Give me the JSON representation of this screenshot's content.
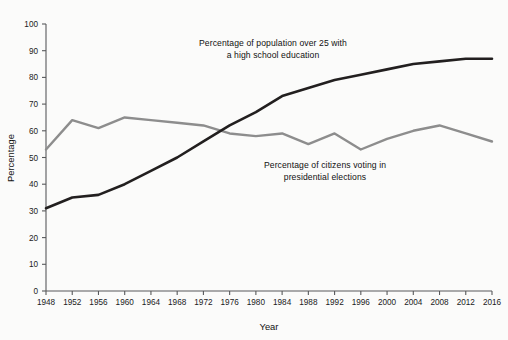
{
  "chart_data": {
    "type": "line",
    "title": "",
    "xlabel": "Year",
    "ylabel": "Percentage",
    "xlim": [
      1948,
      2016
    ],
    "ylim": [
      0,
      100
    ],
    "grid": false,
    "legend_position": "inline-annotations",
    "x": [
      1948,
      1952,
      1956,
      1960,
      1964,
      1968,
      1972,
      1976,
      1980,
      1984,
      1988,
      1992,
      1996,
      2000,
      2004,
      2008,
      2012,
      2016
    ],
    "xtick_labels": [
      "1948",
      "1952",
      "1956",
      "1960",
      "1964",
      "1968",
      "1972",
      "1976",
      "1980",
      "1984",
      "1988",
      "1992",
      "1996",
      "2000",
      "2004",
      "2008",
      "2012",
      "2016"
    ],
    "ytick_labels": [
      "0",
      "10",
      "20",
      "30",
      "40",
      "50",
      "60",
      "70",
      "80",
      "90",
      "100"
    ],
    "yticks": [
      0,
      10,
      20,
      30,
      40,
      50,
      60,
      70,
      80,
      90,
      100
    ],
    "series": [
      {
        "name": "Percentage of population over 25 with a high school education",
        "color": "#221f1f",
        "values": [
          31,
          35,
          36,
          40,
          45,
          50,
          56,
          62,
          67,
          73,
          76,
          79,
          81,
          83,
          85,
          86,
          87,
          87
        ]
      },
      {
        "name": "Percentage of citizens voting in presidential elections",
        "color": "#8d8d8d",
        "values": [
          53,
          64,
          61,
          65,
          64,
          63,
          62,
          59,
          58,
          59,
          55,
          59,
          53,
          57,
          60,
          62,
          59,
          56
        ]
      }
    ],
    "annotations": [
      {
        "id": "education",
        "text": "Percentage of population over 25 with\na high school education"
      },
      {
        "id": "voting",
        "text": "Percentage of citizens voting in\npresidential elections"
      }
    ]
  },
  "axes": {
    "x_title": "Year",
    "y_title": "Percentage"
  }
}
